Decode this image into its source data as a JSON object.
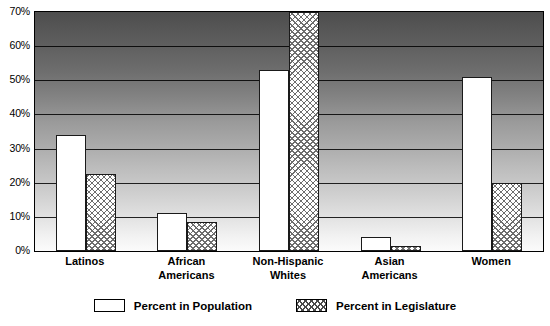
{
  "chart_data": {
    "type": "bar",
    "title": "",
    "xlabel": "",
    "ylabel": "",
    "ylim": [
      0,
      70
    ],
    "grid": true,
    "legend_position": "bottom",
    "categories": [
      "Latinos",
      "African\nAmericans",
      "Non-Hispanic\nWhites",
      "Asian\nAmericans",
      "Women"
    ],
    "series": [
      {
        "name": "Percent in Population",
        "pattern": "solid-white",
        "values": [
          34,
          11,
          53,
          4,
          51
        ]
      },
      {
        "name": "Percent in Legislature",
        "pattern": "crosshatch",
        "values": [
          22.5,
          8.5,
          70,
          1.5,
          20
        ]
      }
    ],
    "y_ticks": [
      {
        "value": 70,
        "label": "70%"
      },
      {
        "value": 60,
        "label": "60%"
      },
      {
        "value": 50,
        "label": "50%"
      },
      {
        "value": 40,
        "label": "40%"
      },
      {
        "value": 30,
        "label": "30%"
      },
      {
        "value": 20,
        "label": "20%"
      },
      {
        "value": 10,
        "label": "10%"
      },
      {
        "value": 0,
        "label": "0%"
      }
    ]
  },
  "legend": {
    "items": [
      {
        "label": "Percent in Population",
        "swatch": "white-swatch"
      },
      {
        "label": "Percent in Legislature",
        "swatch": "crosshatch-swatch"
      }
    ]
  },
  "colors": {
    "axis": "#000000",
    "bar_population": "#ffffff",
    "bar_legislature_hatch": "#6d6d6d",
    "plot_gradient_top": "#4d4d4d",
    "plot_gradient_bottom": "#fbfbfb"
  }
}
